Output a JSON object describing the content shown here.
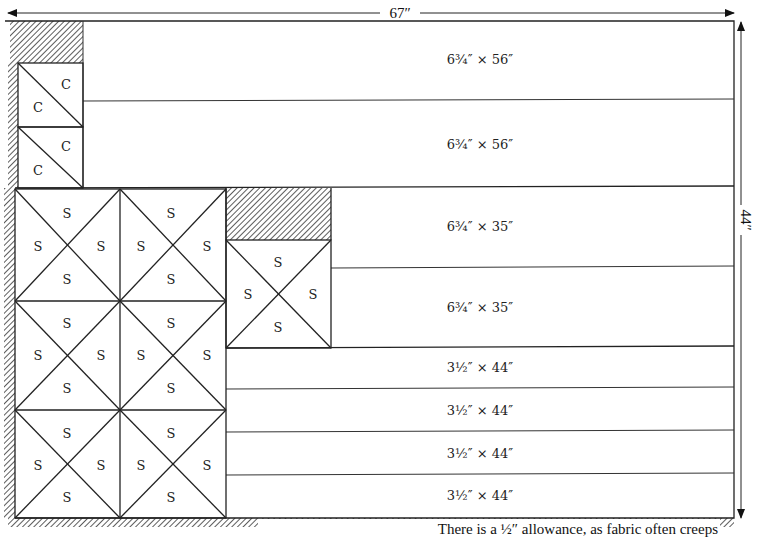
{
  "dimensions": {
    "width_label": "67″",
    "height_label": "44″"
  },
  "strips": [
    {
      "label": "6¾″ × 56″"
    },
    {
      "label": "6¾″ × 56″"
    },
    {
      "label": "6¾″ × 35″"
    },
    {
      "label": "6¾″ × 35″"
    },
    {
      "label": "3½″ × 44″"
    },
    {
      "label": "3½″ × 44″"
    },
    {
      "label": "3½″ × 44″"
    },
    {
      "label": "3½″ × 44″"
    }
  ],
  "pieces": {
    "c_label": "C",
    "s_label": "S"
  },
  "note": "There is a ½″ allowance, as fabric often creeps",
  "colors": {
    "line": "#222222",
    "hatch": "#333333",
    "background": "#ffffff"
  }
}
